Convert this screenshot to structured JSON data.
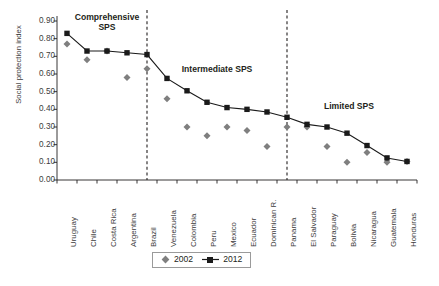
{
  "chart_data": {
    "type": "line",
    "title": "",
    "xlabel": "",
    "ylabel": "Social protection index",
    "ylim": [
      0.0,
      0.9
    ],
    "ytick_labels": [
      "0.90",
      "0.80",
      "0.70",
      "0.60",
      "0.50",
      "0.40",
      "0.30",
      "0.20",
      "0.10",
      "0.00"
    ],
    "ytick_values": [
      0.9,
      0.8,
      0.7,
      0.6,
      0.5,
      0.4,
      0.3,
      0.2,
      0.1,
      0.0
    ],
    "grid": false,
    "legend_position": "bottom-center",
    "categories": [
      "Uruguay",
      "Chile",
      "Costa Rica",
      "Argentina",
      "Brazil",
      "Venezuela",
      "Colombia",
      "Peru",
      "Mexico",
      "Ecuador",
      "Dominican R.",
      "Panama",
      "El Salvador",
      "Paraguay",
      "Bolivia",
      "Nicaragua",
      "Guatemala",
      "Honduras"
    ],
    "series": [
      {
        "name": "2002",
        "marker": "diamond",
        "color": "#7f7f7f",
        "line": false,
        "values": [
          0.77,
          0.68,
          0.73,
          0.58,
          0.63,
          0.46,
          0.3,
          0.25,
          0.3,
          0.28,
          0.19,
          0.3,
          0.3,
          0.19,
          0.1,
          0.155,
          0.1,
          0.105
        ]
      },
      {
        "name": "2012",
        "marker": "square",
        "color": "#1a1a1a",
        "line": true,
        "values": [
          0.83,
          0.73,
          0.73,
          0.72,
          0.71,
          0.575,
          0.505,
          0.44,
          0.41,
          0.4,
          0.385,
          0.355,
          0.315,
          0.3,
          0.265,
          0.195,
          0.125,
          0.105
        ]
      }
    ],
    "dividers": [
      {
        "after_category": "Brazil",
        "index": 4.5
      },
      {
        "after_category": "Panama",
        "index": 11.5
      }
    ],
    "annotations": [
      {
        "name": "comprehensive-sps-label",
        "text": "Comprehensive\nSPS",
        "line1": "Comprehensive",
        "line2": "SPS"
      },
      {
        "name": "intermediate-sps-label",
        "text": "Intermediate SPS"
      },
      {
        "name": "limited-sps-label",
        "text": "Limited SPS"
      }
    ]
  },
  "legend": {
    "items": [
      {
        "label": "2002"
      },
      {
        "label": "2012"
      }
    ]
  },
  "colors": {
    "series_2002": "#7f7f7f",
    "series_2012": "#1a1a1a",
    "axis": "#231f20",
    "text": "#231f20"
  }
}
